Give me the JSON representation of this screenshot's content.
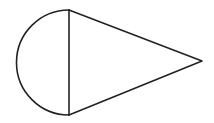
{
  "canvas": {
    "width": 214,
    "height": 123,
    "background": "#ffffff"
  },
  "style": {
    "stroke": "#222222",
    "stroke_width": 1.6
  },
  "shape": {
    "description": "Semicircle joined to an isosceles triangle along a shared vertical diameter",
    "semicircle": {
      "center": [
        69,
        62.5
      ],
      "radius": 53,
      "side": "left",
      "diameter_endpoints": [
        [
          69,
          10
        ],
        [
          69,
          115
        ]
      ]
    },
    "triangle": {
      "vertices": [
        [
          69,
          10
        ],
        [
          202,
          61
        ],
        [
          69,
          115
        ]
      ]
    }
  }
}
